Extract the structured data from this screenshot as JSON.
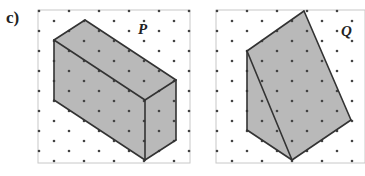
{
  "part_label": "c)",
  "figures": [
    {
      "name": "P",
      "frame": {
        "x": 38,
        "y": 10,
        "w": 152,
        "h": 153
      },
      "label_pos": [
        138,
        34
      ],
      "faces": [
        {
          "points": "85,20 176,80 145,100 54,40"
        },
        {
          "points": "54,40 145,100 145,160 54,100"
        },
        {
          "points": "145,100 176,80 176,140 145,160"
        }
      ],
      "edges": [
        [
          85,
          20,
          176,
          80
        ],
        [
          176,
          80,
          145,
          100
        ],
        [
          145,
          100,
          54,
          40
        ],
        [
          54,
          40,
          85,
          20
        ],
        [
          54,
          40,
          54,
          100
        ],
        [
          54,
          100,
          145,
          160
        ],
        [
          145,
          100,
          145,
          160
        ],
        [
          145,
          160,
          176,
          140
        ],
        [
          176,
          140,
          176,
          80
        ]
      ]
    },
    {
      "name": "Q",
      "frame": {
        "x": 216,
        "y": 10,
        "w": 149,
        "h": 153
      },
      "label_pos": [
        341,
        36
      ],
      "faces": [
        {
          "points": "247,51 304,11 351,120 292,160"
        },
        {
          "points": "247,51 292,160 247,130"
        }
      ],
      "edges": [
        [
          247,
          51,
          304,
          11
        ],
        [
          304,
          11,
          351,
          120
        ],
        [
          351,
          120,
          292,
          160
        ],
        [
          292,
          160,
          247,
          130
        ],
        [
          247,
          130,
          247,
          51
        ],
        [
          247,
          51,
          292,
          160
        ]
      ]
    }
  ],
  "grid": {
    "dx": 15,
    "dy": 10,
    "dot_color": "#444444"
  },
  "colors": {
    "face": "#b9b9b9",
    "edge": "#333333",
    "frame": "#c8c8c8"
  }
}
